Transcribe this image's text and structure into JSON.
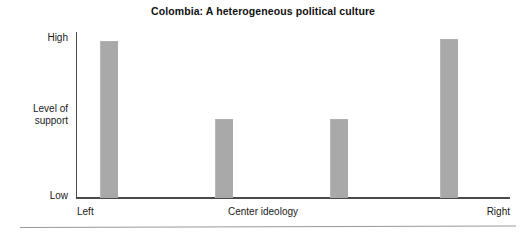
{
  "figure": {
    "title": "Colombia: A heterogeneous political culture",
    "bottom_rule": true
  },
  "axes": {
    "y_top_label": "High",
    "y_middle_label": "Level of\nsupport",
    "y_bottom_label": "Low",
    "x_left_label": "Left",
    "x_center_label": "Center ideology",
    "x_right_label": "Right"
  },
  "colors": {
    "bar_fill": "#a9a9a9",
    "axis": "#4a4a4a",
    "text": "#1a1a1a",
    "background": "#ffffff",
    "rule": "#999999"
  },
  "chart_data": {
    "type": "bar",
    "title": "Colombia: A heterogeneous political culture",
    "xlabel": "Center ideology",
    "ylabel": "Level of support",
    "categories": [
      "Left",
      "Center-left",
      "Center-right",
      "Right"
    ],
    "values": [
      100,
      50,
      50,
      101
    ],
    "ylim": [
      0,
      105
    ],
    "ytick_labels": [
      "Low",
      "High"
    ],
    "ytick_values": [
      0,
      100
    ],
    "xtick_labels": [
      "Left",
      "Center ideology",
      "Right"
    ],
    "grid": false,
    "legend": false,
    "series": [
      {
        "name": "Level of support",
        "values": [
          100,
          50,
          50,
          101
        ]
      }
    ],
    "bars": [
      {
        "category": "Left",
        "value": 100,
        "x_px": 100,
        "width_px": 18
      },
      {
        "category": "Center-left",
        "value": 50,
        "x_px": 215,
        "width_px": 18
      },
      {
        "category": "Center-right",
        "value": 50,
        "x_px": 330,
        "width_px": 18
      },
      {
        "category": "Right",
        "value": 101,
        "x_px": 440,
        "width_px": 18
      }
    ]
  }
}
